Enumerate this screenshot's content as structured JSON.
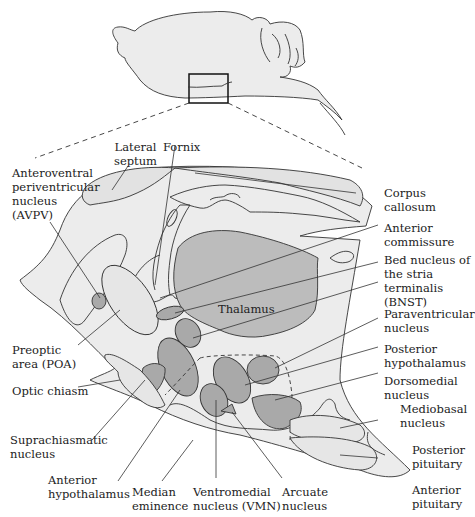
{
  "colors": {
    "tissue_light": "#ececec",
    "nucleus_gray": "#a9a9a9",
    "thalamus_gray": "#bcbcbc",
    "outline": "#333333",
    "text": "#222222"
  },
  "overview": {
    "description": "Sagittal view of rodent brain with inset box marking hypothalamic region"
  },
  "labels": {
    "lateral_septum": "Lateral\nseptum",
    "fornix": "Fornix",
    "avpv": "Anteroventral\nperiventricular\nnucleus\n(AVPV)",
    "corpus_callosum": "Corpus\ncallosum",
    "anterior_commissure": "Anterior\ncommissure",
    "bnst": "Bed nucleus of\nthe stria\nterminalis\n(BNST)",
    "thalamus": "Thalamus",
    "paraventricular": "Paraventricular\nnucleus",
    "poa": "Preoptic\narea (POA)",
    "posterior_hypothalamus": "Posterior\nhypothalamus",
    "optic_chiasm": "Optic chiasm",
    "dorsomedial": "Dorsomedial\nnucleus",
    "mediobasal": "Mediobasal\nnucleus",
    "suprachiasmatic": "Suprachiasmatic\nnucleus",
    "posterior_pituitary": "Posterior\npituitary",
    "anterior_hypothalamus": "Anterior\nhypothalamus",
    "median_eminence": "Median\neminence",
    "vmn": "Ventromedial\nnucleus (VMN)",
    "arcuate": "Arcuate\nnucleus",
    "anterior_pituitary": "Anterior\npituitary"
  }
}
